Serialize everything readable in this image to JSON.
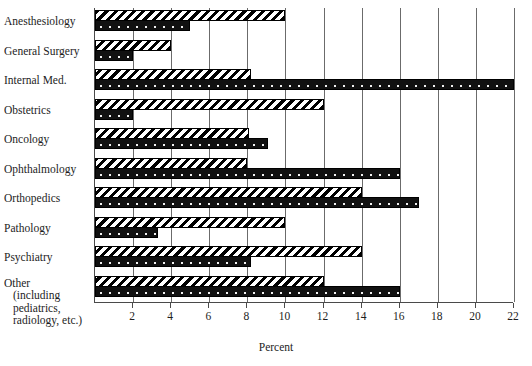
{
  "chart_data": {
    "type": "bar",
    "orientation": "horizontal",
    "title": "",
    "xlabel": "Percent",
    "ylabel": "",
    "xlim": [
      0,
      22
    ],
    "xticks": [
      2,
      4,
      6,
      8,
      10,
      12,
      14,
      16,
      18,
      20,
      22
    ],
    "grid": true,
    "legend": "none",
    "categories": [
      "Anesthesiology",
      "General Surgery",
      "Internal Med.",
      "Obstetrics",
      "Oncology",
      "Ophthalmology",
      "Orthopedics",
      "Pathology",
      "Psychiatry",
      "Other"
    ],
    "other_label_lines": [
      "Other",
      "(including",
      "pediatrics,",
      "radiology, etc.)"
    ],
    "series": [
      {
        "name": "hatched",
        "pattern": "diagonal-stripes",
        "values": [
          10.0,
          4.0,
          8.2,
          12.0,
          8.1,
          8.0,
          14.0,
          10.0,
          14.0,
          12.0
        ]
      },
      {
        "name": "dotted",
        "pattern": "solid-dark-dotted",
        "values": [
          5.0,
          2.0,
          22.0,
          2.0,
          9.1,
          16.0,
          17.0,
          3.3,
          8.2,
          16.0
        ]
      }
    ],
    "colors": {
      "bar_dark": "#111111",
      "bar_light": "#ffffff",
      "axis": "#4a4a4a",
      "grid": "#6b6b6b",
      "text": "#1d1d1d"
    }
  }
}
